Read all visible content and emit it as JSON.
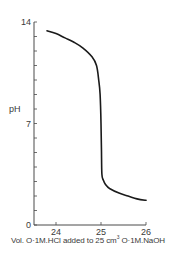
{
  "chart_data": {
    "type": "line",
    "title": "",
    "xlabel": "Vol. 0·1M.HCl added to 25 cm³ 0·1M.NaOH",
    "xlabel_parts": {
      "prefix": "Vol. O·1M.HCl added to 25 cm",
      "superscript": "3",
      "suffix": " O·1M.NaOH"
    },
    "ylabel": "pH",
    "xlim": [
      23.5,
      26
    ],
    "ylim": [
      0,
      14
    ],
    "x_ticks": [
      24,
      25,
      26
    ],
    "x_tick_labels": [
      "24",
      "25",
      "26"
    ],
    "y_ticks_labeled": [
      0,
      7,
      14
    ],
    "y_tick_labels": [
      "0",
      "7",
      "14"
    ],
    "y_minor_ticks": [
      1,
      2,
      3,
      4,
      5,
      6,
      8,
      9,
      10,
      11,
      12,
      13
    ],
    "grid": false,
    "legend": null,
    "series": [
      {
        "name": "pH titration curve",
        "color": "#1a1a1a",
        "x": [
          23.8,
          24.0,
          24.2,
          24.4,
          24.6,
          24.8,
          24.9,
          24.95,
          24.98,
          25.0,
          25.01,
          25.02,
          25.05,
          25.1,
          25.2,
          25.4,
          25.6,
          25.8,
          26.0
        ],
        "y": [
          13.4,
          13.2,
          12.9,
          12.6,
          12.2,
          11.6,
          11.0,
          10.0,
          9.0,
          7.0,
          5.0,
          3.5,
          3.1,
          2.8,
          2.5,
          2.2,
          2.0,
          1.8,
          1.7
        ]
      }
    ]
  },
  "colors": {
    "axis": "#4a4a4a",
    "curve": "#1a1a1a",
    "text": "#3a3a3a",
    "background": "#ffffff"
  }
}
